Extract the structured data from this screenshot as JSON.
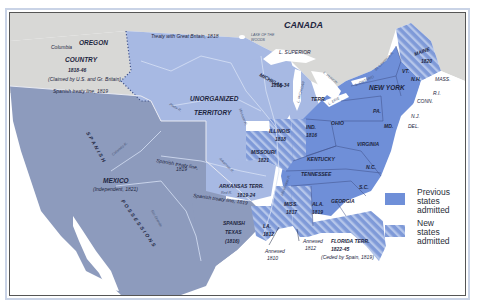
{
  "map": {
    "colors": {
      "foreign_land": "#d8d8d6",
      "us_territory": "#a7b9e3",
      "spanish_mexico": "#8d9bbd",
      "previous_states": "#6f8fd8",
      "new_states_hatch_bg": "#7f9ad8",
      "new_states_hatch_line": "#b5c6ea",
      "water": "#ffffff",
      "border_dotted": "#3e4f86"
    },
    "regions": {
      "canada": "CANADA",
      "oregon_line1": "OREGON",
      "oregon_line2": "COUNTRY",
      "oregon_dates": "1818-46",
      "oregon_claim": "(Claimed by U.S. and Gr. Britain)",
      "columbia": "Columbia",
      "treaty_gb": "Treaty with Great Britain, 1818",
      "lake_woods_1": "LAKE OF THE",
      "lake_woods_2": "WOODS",
      "l_superior": "L. SUPERIOR",
      "l_michigan": "L. MICHIGAN",
      "l_huron": "L. HURON",
      "l_ontario": "L. ONTARIO",
      "l_erie": "L. ERIE",
      "st_lawrence": "St. Lawrence R.",
      "michigan_terr_1": "MICHIGAN",
      "michigan_terr_dates": "1818-34",
      "michigan_terr_2": "TERR.",
      "unorganized_1": "UNORGANIZED",
      "unorganized_2": "TERRITORY",
      "spanish_treaty_line_top": "Spanish treaty line, 1819",
      "spanish_treaty_line_mid1": "Spanish treaty line,",
      "spanish_treaty_line_mid2": "1819",
      "spanish_treaty_line_low": "Spanish treaty line, 1819",
      "spanish_possessions": "SPANISH POSSESSIONS",
      "mexico": "MEXICO",
      "mexico_indep": "(Independent, 1821)",
      "colorado_r": "Colorado R.",
      "rio_grande": "Rio Grande",
      "platte_r": "Platte R.",
      "missouri_r": "Missouri R.",
      "arkansas_r": "Arkansas R.",
      "red_r": "Red R.",
      "mississippi_r": "Mississippi R.",
      "arkansas_terr_1": "ARKANSAS TERR.",
      "arkansas_terr_dates": "1819-24",
      "spanish_texas_1": "SPANISH",
      "spanish_texas_2": "TEXAS",
      "spanish_texas_date": "(1816)",
      "florida_terr_1": "FLORIDA TERR.",
      "florida_terr_dates": "1822-45",
      "florida_ceded": "(Ceded by Spain, 1819)",
      "annexed_1810_1": "Annexed",
      "annexed_1810_2": "1810",
      "annexed_1812_1": "Annexed",
      "annexed_1812_2": "1812"
    },
    "states": {
      "maine": "MAINE",
      "maine_date": "1820",
      "vt": "VT.",
      "nh": "N.H.",
      "mass": "MASS.",
      "ri": "R.I.",
      "conn": "CONN.",
      "new_york": "NEW YORK",
      "nj": "N.J.",
      "del": "DEL.",
      "pa": "PA.",
      "md": "MD.",
      "ohio": "OHIO",
      "virginia": "VIRGINIA",
      "kentucky": "KENTUCKY",
      "tennessee": "TENNESSEE",
      "nc": "N.C.",
      "sc": "S.C.",
      "georgia": "GEORGIA",
      "illinois": "ILLINOIS",
      "illinois_date": "1818",
      "ind": "IND.",
      "ind_date": "1816",
      "missouri": "MISSOURI",
      "missouri_date": "1821",
      "miss": "MISS.",
      "miss_date": "1817",
      "ala": "ALA.",
      "ala_date": "1819",
      "la": "LA.",
      "la_date": "1812"
    },
    "legend": {
      "previous_1": "Previous",
      "previous_2": "states",
      "previous_3": "admitted",
      "new_1": "New",
      "new_2": "states",
      "new_3": "admitted"
    }
  }
}
